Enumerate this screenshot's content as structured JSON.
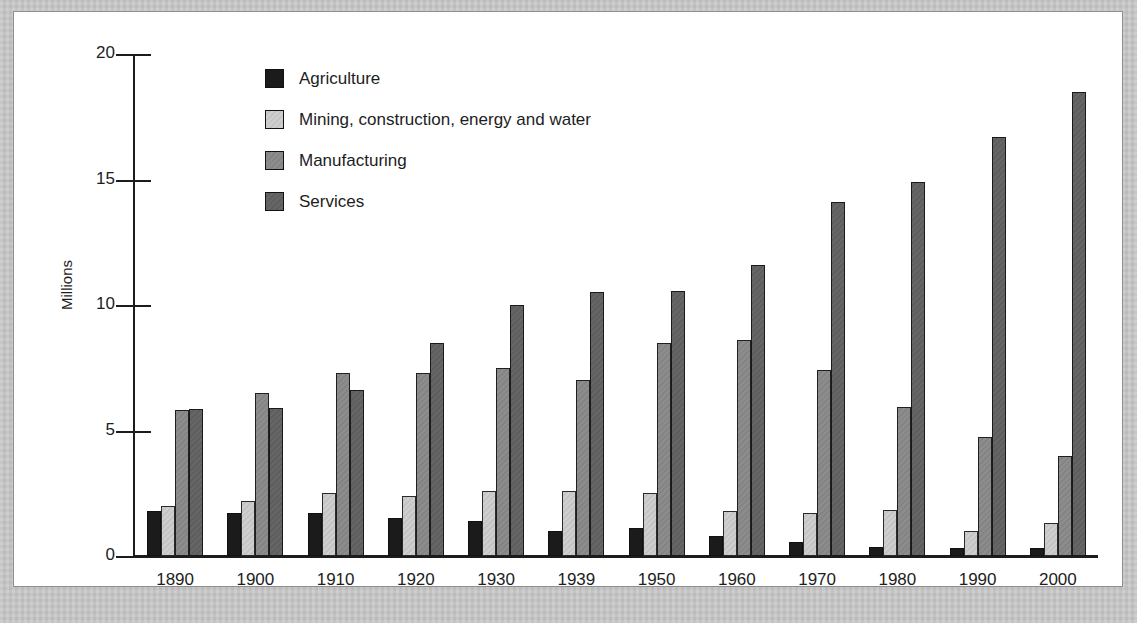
{
  "chart_data": {
    "type": "bar",
    "title": "",
    "xlabel": "",
    "ylabel": "Millions",
    "ylim": [
      0,
      20
    ],
    "yticks": [
      "0",
      "5",
      "10",
      "15",
      "20"
    ],
    "grid": false,
    "legend_position": "top-center",
    "categories": [
      "1890",
      "1900",
      "1910",
      "1920",
      "1930",
      "1939",
      "1950",
      "1960",
      "1970",
      "1980",
      "1990",
      "2000"
    ],
    "series": [
      {
        "name": "Agriculture",
        "color": "#1b1b1b",
        "values": [
          1.8,
          1.7,
          1.7,
          1.5,
          1.4,
          1.0,
          1.1,
          0.8,
          0.55,
          0.35,
          0.3,
          0.3
        ]
      },
      {
        "name": "Mining, construction, energy and water",
        "color": "#cfcfcf",
        "values": [
          2.0,
          2.2,
          2.5,
          2.4,
          2.6,
          2.6,
          2.5,
          1.8,
          1.7,
          1.85,
          1.0,
          1.3
        ]
      },
      {
        "name": "Manufacturing",
        "color": "#8d8d8d",
        "values": [
          5.8,
          6.5,
          7.3,
          7.3,
          7.5,
          7.0,
          8.5,
          8.6,
          7.4,
          5.95,
          4.75,
          4.0
        ]
      },
      {
        "name": "Services",
        "color": "#666666",
        "values": [
          5.85,
          5.9,
          6.6,
          8.5,
          10.0,
          10.5,
          10.55,
          11.6,
          14.1,
          14.9,
          16.7,
          18.5
        ]
      }
    ]
  }
}
